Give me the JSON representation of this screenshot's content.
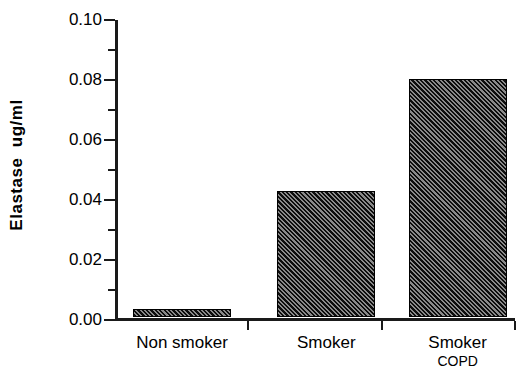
{
  "chart_data": {
    "type": "bar",
    "title": "",
    "subtitle": "",
    "xlabel": "",
    "ylabel": "Elastase  ug/ml",
    "categories": [
      "Non smoker",
      "Smoker",
      "Smoker"
    ],
    "category_sublabels": [
      "",
      "",
      "COPD"
    ],
    "values": [
      0.0027,
      0.042,
      0.0795
    ],
    "ylim": [
      0.0,
      0.1
    ],
    "ytick_labels": [
      "0.10",
      "0.08",
      "0.06",
      "0.04",
      "0.02",
      "0.00"
    ],
    "ytick_values": [
      0.1,
      0.08,
      0.06,
      0.04,
      0.02,
      0.0
    ],
    "yminor_tick_values": [
      0.09,
      0.07,
      0.05,
      0.03,
      0.01
    ],
    "grid": false,
    "legend": false,
    "legend_position": "none",
    "bar_fill": "diagonal-hatch",
    "colors": {
      "axis": "#1a1a1a",
      "bar_edge": "#000000",
      "bar_hatch": "#0d0d0d",
      "background": "#ffffff"
    }
  },
  "axis": {
    "y_title": "Elastase  ug/ml"
  }
}
